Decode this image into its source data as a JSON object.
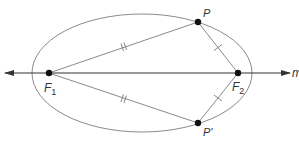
{
  "diagram": {
    "type": "ellipse-foci",
    "colors": {
      "ellipse": "#8a8a8a",
      "segments": "#8a8a8a",
      "axis": "#333333",
      "points": "#111111",
      "labels": "#333333"
    },
    "ellipse": {
      "cx": 142,
      "cy": 73,
      "rx": 110,
      "ry": 59
    },
    "axis": {
      "label": "m",
      "y": 73,
      "x1": 5,
      "x2": 290
    },
    "points": {
      "F1": {
        "label": "F",
        "sub": "1",
        "x": 49,
        "y": 73
      },
      "F2": {
        "label": "F",
        "sub": "2",
        "x": 238,
        "y": 73
      },
      "P": {
        "label": "P",
        "x": 198,
        "y": 22
      },
      "Pp": {
        "label": "P'",
        "x": 198,
        "y": 123
      }
    },
    "segments": [
      {
        "from": "F1",
        "to": "P",
        "ticks": 2
      },
      {
        "from": "F1",
        "to": "Pp",
        "ticks": 2
      },
      {
        "from": "P",
        "to": "F2",
        "ticks": 1
      },
      {
        "from": "Pp",
        "to": "F2",
        "ticks": 1
      }
    ]
  }
}
